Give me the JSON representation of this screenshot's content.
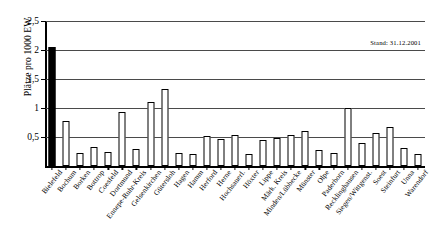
{
  "chart_data": {
    "type": "bar",
    "title": "",
    "xlabel": "",
    "ylabel": "Plätze pro 1000 EW",
    "ylim": [
      0,
      2.5
    ],
    "yticks": [
      "0,5",
      "1",
      "1,5",
      "2",
      "2,5"
    ],
    "ytick_values": [
      0.5,
      1,
      1.5,
      2,
      2.5
    ],
    "grid": true,
    "legend": "none",
    "annotation": "Stand: 31.12.2001",
    "highlight_category": "Bielefeld",
    "highlight_color": "#000000",
    "bar_color": "#ffffff",
    "bar_edge_color": "#000000",
    "categories": [
      "Bielefeld",
      "Bochum",
      "Borken",
      "Bottrop",
      "Coesfeld",
      "Dortmund",
      "Ennepe-Ruhr-Kreis",
      "Gelsenkirchen",
      "Gütersloh",
      "Hagen",
      "Hamm",
      "Herford",
      "Herne",
      "Hochsauerl.",
      "Höxter",
      "Lippe",
      "Märk. Kreis",
      "Minden/Lübbecke",
      "Münster",
      "Olpe",
      "Paderborn",
      "Recklinghausen",
      "Siegen/Wittgenst.",
      "Soest",
      "Steinfurt",
      "Unna",
      "Warendorf"
    ],
    "values": [
      2.05,
      0.78,
      0.22,
      0.32,
      0.25,
      0.93,
      0.3,
      1.1,
      1.32,
      0.23,
      0.21,
      0.52,
      0.47,
      0.53,
      0.2,
      0.45,
      0.48,
      0.54,
      0.61,
      0.27,
      0.23,
      1.0,
      0.4,
      0.57,
      0.67,
      0.31,
      0.2
    ]
  }
}
